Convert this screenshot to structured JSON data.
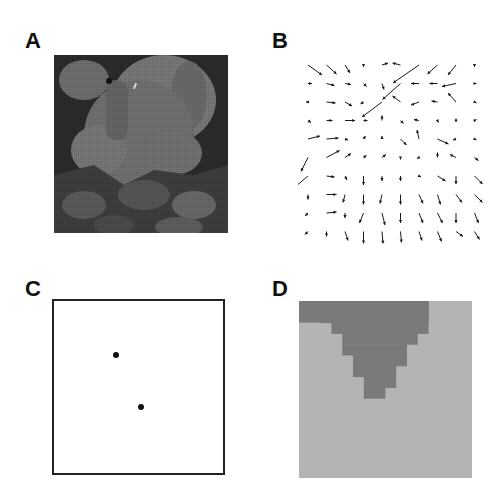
{
  "panels": {
    "A": {
      "label": "A",
      "content": "grayscale photograph of stuffed toy elephant with leaves"
    },
    "B": {
      "label": "B",
      "content": "optical flow vector field"
    },
    "C": {
      "label": "C",
      "content": "two points in square frame"
    },
    "D": {
      "label": "D",
      "content": "segmentation map"
    }
  },
  "colors": {
    "text": "#111111",
    "frame": "#222222",
    "dark_region": "#7a7a7a",
    "light_region": "#b4b4b4",
    "arrow": "#1a1a1a"
  },
  "vector_field": {
    "grid": {
      "cols": 10,
      "rows": 10,
      "x0": 10,
      "y0": 7,
      "dx": 18.5,
      "dy": 18.5
    },
    "vectors": [
      [
        [
          14,
          10
        ],
        [
          10,
          9
        ],
        [
          5,
          8
        ],
        [
          0,
          2
        ],
        [
          6,
          -2
        ],
        [
          -8,
          -2
        ],
        [
          -26,
          18
        ],
        [
          -10,
          9
        ],
        [
          -8,
          10
        ],
        [
          0,
          2
        ]
      ],
      [
        [
          4,
          0
        ],
        [
          8,
          2
        ],
        [
          6,
          1
        ],
        [
          3,
          3
        ],
        [
          2,
          6
        ],
        [
          -18,
          16
        ],
        [
          -8,
          0
        ],
        [
          -8,
          0
        ],
        [
          -14,
          3
        ],
        [
          2,
          0
        ]
      ],
      [
        [
          -2,
          0
        ],
        [
          9,
          1
        ],
        [
          7,
          4
        ],
        [
          -3,
          2
        ],
        [
          -20,
          15
        ],
        [
          -8,
          -6
        ],
        [
          -8,
          3
        ],
        [
          -6,
          -1
        ],
        [
          -8,
          -9
        ],
        [
          2,
          1
        ]
      ],
      [
        [
          3,
          2
        ],
        [
          6,
          0
        ],
        [
          10,
          0
        ],
        [
          4,
          0
        ],
        [
          0,
          -5
        ],
        [
          3,
          3
        ],
        [
          -5,
          -1
        ],
        [
          1,
          2
        ],
        [
          0,
          -2
        ],
        [
          2,
          -1
        ]
      ],
      [
        [
          12,
          -3
        ],
        [
          12,
          -1
        ],
        [
          3,
          1
        ],
        [
          2,
          -3
        ],
        [
          0,
          -3
        ],
        [
          6,
          6
        ],
        [
          -2,
          -9
        ],
        [
          11,
          5
        ],
        [
          -3,
          1
        ],
        [
          2,
          1
        ]
      ],
      [
        [
          -7,
          14
        ],
        [
          13,
          -7
        ],
        [
          6,
          -4
        ],
        [
          3,
          -2
        ],
        [
          4,
          -3
        ],
        [
          0,
          2
        ],
        [
          -2,
          1
        ],
        [
          0,
          -5
        ],
        [
          -6,
          -3
        ],
        [
          4,
          3
        ]
      ],
      [
        [
          -13,
          11
        ],
        [
          8,
          1
        ],
        [
          2,
          4
        ],
        [
          0,
          9
        ],
        [
          0,
          5
        ],
        [
          0,
          5
        ],
        [
          2,
          1
        ],
        [
          8,
          5
        ],
        [
          0,
          8
        ],
        [
          8,
          8
        ]
      ],
      [
        [
          0,
          5
        ],
        [
          10,
          0
        ],
        [
          -2,
          8
        ],
        [
          0,
          10
        ],
        [
          -2,
          9
        ],
        [
          0,
          10
        ],
        [
          4,
          9
        ],
        [
          3,
          10
        ],
        [
          6,
          8
        ],
        [
          8,
          8
        ]
      ],
      [
        [
          -3,
          3
        ],
        [
          10,
          -1
        ],
        [
          0,
          5
        ],
        [
          -4,
          10
        ],
        [
          3,
          12
        ],
        [
          0,
          10
        ],
        [
          4,
          10
        ],
        [
          5,
          10
        ],
        [
          0,
          10
        ],
        [
          4,
          10
        ]
      ],
      [
        [
          -3,
          3
        ],
        [
          0,
          5
        ],
        [
          3,
          9
        ],
        [
          0,
          12
        ],
        [
          1,
          12
        ],
        [
          1,
          11
        ],
        [
          3,
          9
        ],
        [
          4,
          10
        ],
        [
          7,
          5
        ],
        [
          5,
          8
        ]
      ]
    ]
  },
  "dots": [
    {
      "x": 116,
      "y": 355
    },
    {
      "x": 141,
      "y": 407
    }
  ],
  "segmentation": {
    "cell": 10.8,
    "dark_rows": [
      [
        0,
        12
      ],
      [
        2,
        12
      ],
      [
        3,
        12
      ],
      [
        4,
        11
      ],
      [
        4,
        10
      ],
      [
        5,
        10
      ],
      [
        5,
        9
      ],
      [
        6,
        9
      ],
      [
        6,
        8
      ]
    ],
    "row0_full_left": true
  }
}
